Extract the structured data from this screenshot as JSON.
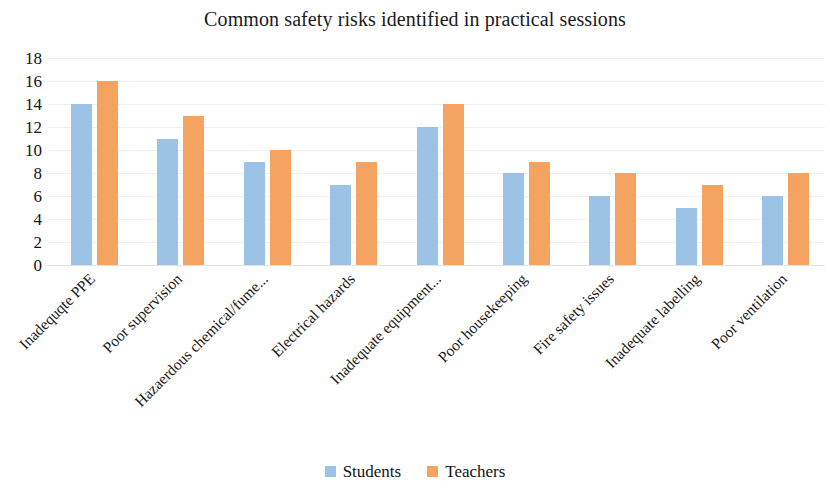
{
  "chart_data": {
    "type": "bar",
    "title": "Common safety risks identified in practical sessions",
    "xlabel": "",
    "ylabel": "",
    "ylim": [
      0,
      18
    ],
    "ytick_step": 2,
    "yticks": [
      "18",
      "16",
      "14",
      "12",
      "10",
      "8",
      "6",
      "4",
      "2",
      "0"
    ],
    "grid": true,
    "grid_axis": "y",
    "legend_position": "bottom-center",
    "orientation": "vertical",
    "categories": [
      "Inadequqte PPE",
      "Poor supervision",
      "Hazaerdous chemical/fume...",
      "Electrical hazards",
      "Inadequate equipment...",
      "Poor housekeeping",
      "Fire safety issues",
      "Inadequate labelling",
      "Poor ventilation"
    ],
    "series": [
      {
        "name": "Students",
        "color": "#9CC3E5",
        "values": [
          14,
          11,
          9,
          7,
          12,
          8,
          6,
          5,
          6
        ]
      },
      {
        "name": "Teachers",
        "color": "#F4A460",
        "values": [
          16,
          13,
          10,
          9,
          14,
          9,
          8,
          7,
          8
        ]
      }
    ]
  }
}
